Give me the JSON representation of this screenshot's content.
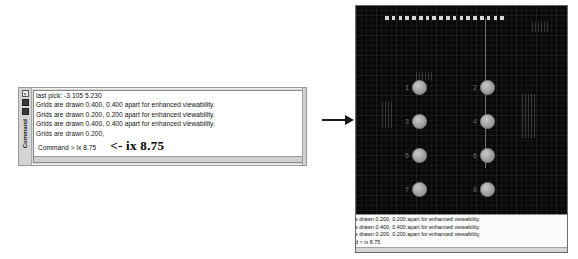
{
  "left_window": {
    "title_strip": {
      "vertical_label": "Command",
      "close_icon": "close-icon",
      "pin_icon": "pin-icon"
    },
    "lines": [
      "last pick:  -3.105 5.230",
      "Grids are drawn 0.400, 0.400 apart for enhanced viewability.",
      "Grids are drawn 0.200, 0.200 apart for enhanced viewability.",
      "Grids are drawn 0.400, 0.400 apart for enhanced viewability.",
      "Grids are drawn 0.200,"
    ],
    "prompt": "Command > ix 8.75",
    "annotation": "<- ix 8.75"
  },
  "arrow": {
    "name": "flow-arrow",
    "glyph": "→"
  },
  "cad_panel": {
    "viewport": {
      "background_color": "#090909",
      "grid_color": "#ffffff",
      "marker_count": 18,
      "marker_color": "#d8d8d8",
      "circles": [
        {
          "label": "1",
          "column": "A",
          "row": 1
        },
        {
          "label": "2",
          "column": "B",
          "row": 1
        },
        {
          "label": "3",
          "column": "A",
          "row": 2
        },
        {
          "label": "4",
          "column": "B",
          "row": 2
        },
        {
          "label": "5",
          "column": "A",
          "row": 3
        },
        {
          "label": "6",
          "column": "B",
          "row": 3
        },
        {
          "label": "7",
          "column": "A",
          "row": 4
        },
        {
          "label": "8",
          "column": "B",
          "row": 4
        }
      ]
    },
    "command_strip": {
      "lines": [
        "s drawn 0.200, 0.200 apart for enhanced viewability.",
        "s drawn 0.400, 0.400 apart for enhanced viewability.",
        "s drawn 0.200, 0.200 apart for enhanced viewability.",
        "d > ix 8.75"
      ]
    }
  }
}
